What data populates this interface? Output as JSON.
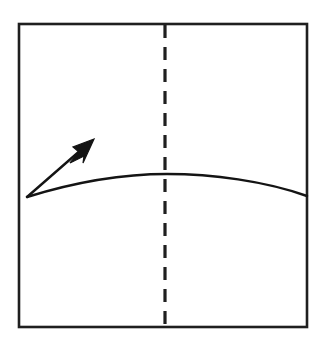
{
  "figure": {
    "domain": "diagram",
    "kind": "projectile-trajectory-schematic",
    "caption": "",
    "canvas": {
      "width": 326,
      "height": 357,
      "background": "#ffffff"
    },
    "colors": {
      "ink": "#1a1a1a",
      "frame": "#1f1f1f",
      "curve": "#141414",
      "dashed_line": "#1f1f1f",
      "background": "#ffffff"
    },
    "frame": {
      "name": "plot-frame",
      "shape": "rectangle",
      "x": 19,
      "y": 24,
      "width": 288,
      "height": 303,
      "stroke_width": 2.6,
      "fill": "none",
      "label": ""
    },
    "trajectory": {
      "name": "trajectory-curve",
      "type": "parabolic-arc",
      "stroke_width": 2.4,
      "start": {
        "x": 27,
        "y": 197
      },
      "apex": {
        "x": 167,
        "y": 174
      },
      "end": {
        "x": 307,
        "y": 196
      },
      "control_points": [
        {
          "x": 27,
          "y": 197
        },
        {
          "x": 96,
          "y": 176
        },
        {
          "x": 167,
          "y": 174
        },
        {
          "x": 240,
          "y": 178
        },
        {
          "x": 307,
          "y": 196
        }
      ],
      "label": ""
    },
    "centerline": {
      "name": "vertical-dashed-centerline",
      "orientation": "vertical",
      "x": 165,
      "y_top": 25,
      "y_bottom": 326,
      "stroke_width": 3.2,
      "dash": 13,
      "gap": 9,
      "label": ""
    },
    "vector_arrow": {
      "name": "initial-velocity-arrow",
      "tail": {
        "x": 27,
        "y": 197
      },
      "tip": {
        "x": 94,
        "y": 139
      },
      "shaft_width": 2.4,
      "head_length": 22,
      "head_width": 13,
      "angle_degrees": 41,
      "label": ""
    },
    "annotations": [],
    "axis_labels": {
      "x": "",
      "y": ""
    },
    "legend": {
      "visible": false,
      "entries": []
    },
    "ticks": {
      "x": [],
      "y": []
    }
  }
}
